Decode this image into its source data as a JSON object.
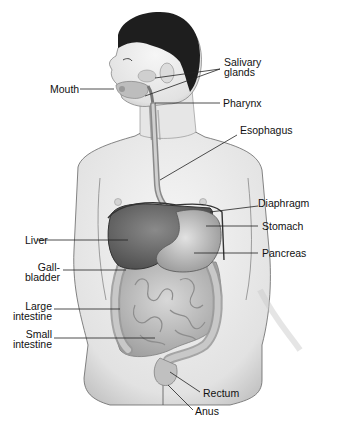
{
  "labels": {
    "salivary_glands_1": "Salivary",
    "salivary_glands_2": "glands",
    "mouth": "Mouth",
    "pharynx": "Pharynx",
    "esophagus": "Esophagus",
    "diaphragm": "Diaphragm",
    "stomach": "Stomach",
    "liver": "Liver",
    "pancreas": "Pancreas",
    "gallbladder_1": "Gall-",
    "gallbladder_2": "bladder",
    "large_intestine_1": "Large",
    "large_intestine_2": "intestine",
    "small_intestine_1": "Small",
    "small_intestine_2": "intestine",
    "rectum": "Rectum",
    "anus": "Anus"
  },
  "colors": {
    "background": "#ffffff",
    "skin": "#ececec",
    "skin_shade": "#c9c9c9",
    "hair": "#1e1e1e",
    "liver": "#6a6a6a",
    "stomach": "#bdbdbd",
    "intestine": "#b5b5b5",
    "outline": "#333333",
    "label_line": "#222222"
  }
}
